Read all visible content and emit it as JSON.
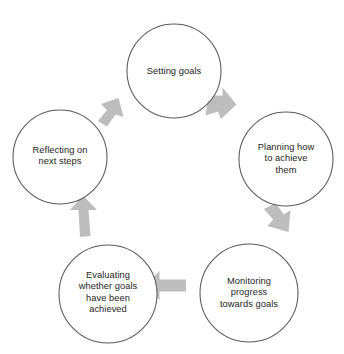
{
  "diagram": {
    "type": "cycle-diagram",
    "canvas": {
      "width": 344,
      "height": 354,
      "background": "#ffffff"
    },
    "style": {
      "circle_fill": "#ffffff",
      "circle_stroke": "#595959",
      "arrow_fill": "#bdbdbd",
      "text_color": "#1d1d1d"
    },
    "nodes": [
      {
        "id": "setting-goals",
        "label": "Setting goals",
        "cx": 174,
        "cy": 71,
        "r": 47,
        "label_x": 174,
        "label_y": 72
      },
      {
        "id": "planning-how-to-achieve-them",
        "label": "Planning how\nto achieve\nthem",
        "cx": 286,
        "cy": 159,
        "r": 47,
        "label_x": 286,
        "label_y": 159
      },
      {
        "id": "monitoring-progress-towards-goals",
        "label": "Monitoring\nprogress\ntowards goals",
        "cx": 249,
        "cy": 293,
        "r": 49,
        "label_x": 249,
        "label_y": 293
      },
      {
        "id": "evaluating-whether-goals-have-been-achieved",
        "label": "Evaluating\nwhether goals\nhave been\nachieved",
        "cx": 108,
        "cy": 294,
        "r": 49,
        "label_x": 108,
        "label_y": 293
      },
      {
        "id": "reflecting-on-next-steps",
        "label": "Reflecting on\nnext steps",
        "cx": 60,
        "cy": 157,
        "r": 47,
        "label_x": 60,
        "label_y": 156
      }
    ],
    "arrows": [
      {
        "id": "arrow-setting-to-planning",
        "from": "setting-goals",
        "to": "planning-how-to-achieve-them",
        "direction": "down-right",
        "points": "208.5,95.5 222.5,95.5 222.5,87.5 236.5,104.5 221.0,119.0 218.0,111.5 205.5,115.5",
        "cx": 220,
        "cy": 107,
        "rotation": 43
      },
      {
        "id": "arrow-planning-to-monitoring",
        "from": "planning-how-to-achieve-them",
        "to": "monitoring-progress-towards-goals",
        "direction": "down-left",
        "points": "275.5,203.0 284.0,214.5 290.5,210.0 288.5,232.0 267.5,226.0 273.0,219.5 264.0,209.0",
        "cx": 277,
        "cy": 217,
        "rotation": 132
      },
      {
        "id": "arrow-monitoring-to-evaluating",
        "from": "monitoring-progress-towards-goals",
        "to": "evaluating-whether-goals-have-been-achieved",
        "direction": "left",
        "points": "159.5,279.5 159.5,271.0 145.0,285.5 159.5,300.0 159.5,291.5 186.0,291.5 186.0,279.5",
        "cx": 165,
        "cy": 286,
        "rotation": 180
      },
      {
        "id": "arrow-evaluating-to-reflecting",
        "from": "evaluating-whether-goals-have-been-achieved",
        "to": "reflecting-on-next-steps",
        "direction": "up",
        "points": "78.5,210.0 70.0,210.0 83.0,195.5 97.0,210.0 88.5,210.0 90.5,236.0 80.0,237.0",
        "cx": 83,
        "cy": 216,
        "rotation": 268
      },
      {
        "id": "arrow-reflecting-to-setting",
        "from": "reflecting-on-next-steps",
        "to": "setting-goals",
        "direction": "up-right",
        "points": "107.0,110.0 101.0,104.0 118.5,98.0 123.5,117.0 115.5,114.5 107.0,126.5 98.0,121.0",
        "cx": 111,
        "cy": 112,
        "rotation": 315
      }
    ]
  }
}
